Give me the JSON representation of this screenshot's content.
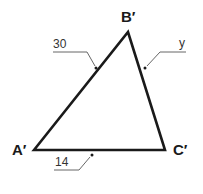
{
  "diagram": {
    "type": "triangle",
    "colors": {
      "stroke": "#1a1a1a",
      "leader": "#555555",
      "background": "#ffffff"
    },
    "vertices": [
      {
        "id": "A",
        "label": "A′",
        "x": 34,
        "y": 150
      },
      {
        "id": "B",
        "label": "B′",
        "x": 128,
        "y": 32
      },
      {
        "id": "C",
        "label": "C′",
        "x": 165,
        "y": 150
      }
    ],
    "sides": [
      {
        "between": "A′B′",
        "label": "30"
      },
      {
        "between": "B′C′",
        "label": "y"
      },
      {
        "between": "A′C′",
        "label": "14"
      }
    ]
  }
}
